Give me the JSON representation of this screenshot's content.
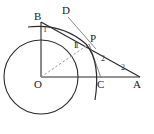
{
  "figure": {
    "canvas": {
      "width": 154,
      "height": 134
    },
    "stroke_color": "#2b2b2b",
    "dashed_color": "#8a8a8a",
    "thin_color": "#6e6e6e",
    "background": "#ffffff",
    "circle": {
      "label": "circle-o",
      "cx": 41,
      "cy": 77,
      "r": 37
    },
    "points": [
      {
        "name": "B",
        "label": "B",
        "x": 41,
        "y": 22,
        "label_x": 34,
        "label_y": 11
      },
      {
        "name": "D",
        "label": "D",
        "x": 69,
        "y": 14,
        "label_x": 62,
        "label_y": 5
      },
      {
        "name": "P",
        "label": "P",
        "x": 89,
        "y": 44,
        "label_x": 90,
        "label_y": 33
      },
      {
        "name": "I",
        "label": "I",
        "x": 78,
        "y": 46,
        "label_x": 74,
        "label_y": 41
      },
      {
        "name": "O",
        "label": "O",
        "x": 41,
        "y": 77,
        "label_x": 34,
        "label_y": 79
      },
      {
        "name": "C",
        "label": "C",
        "x": 100,
        "y": 77,
        "label_x": 97,
        "label_y": 79
      },
      {
        "name": "A",
        "label": "A",
        "x": 140,
        "y": 77,
        "label_x": 133,
        "label_y": 79
      }
    ],
    "segment_labels": [
      {
        "name": "bi-length",
        "label": "1",
        "x": 43,
        "y": 26
      },
      {
        "name": "ip-length",
        "label": "1",
        "x": 75,
        "y": 42
      },
      {
        "name": "pc-length",
        "label": "2",
        "x": 101,
        "y": 55
      },
      {
        "name": "ca-length",
        "label": "2",
        "x": 121,
        "y": 64
      }
    ],
    "segments": [
      {
        "name": "segment-ob",
        "from": "O",
        "to": "B",
        "style": "solid"
      },
      {
        "name": "segment-oa",
        "from": "O",
        "to": "A",
        "style": "solid"
      },
      {
        "name": "segment-ba",
        "from": "B",
        "to": "A",
        "style": "solid"
      },
      {
        "name": "segment-op",
        "from": "O",
        "to": "P",
        "style": "dashed"
      },
      {
        "name": "segment-dp",
        "from": "D",
        "to": "P",
        "style": "thin"
      },
      {
        "name": "segment-pc",
        "from": "P",
        "to": "C",
        "style": "thin"
      },
      {
        "name": "arc-bpc",
        "from": "B",
        "to": "C",
        "style": "arc"
      }
    ]
  }
}
